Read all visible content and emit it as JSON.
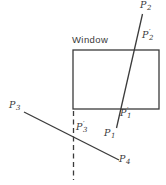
{
  "diagram": {
    "title": "Window",
    "background_color": "#ffffff",
    "stroke_color": "#3b3b3b",
    "text_color": "#3a3a3a",
    "window_rect": {
      "x": 73,
      "y": 50,
      "width": 86,
      "height": 59
    },
    "lines": [
      {
        "name": "line-p2-p1",
        "x1": 142.5,
        "y1": 14,
        "x2": 116.5,
        "y2": 128,
        "dashed": false
      },
      {
        "name": "line-p3-p4",
        "x1": 24,
        "y1": 112,
        "x2": 119,
        "y2": 160,
        "dashed": false
      },
      {
        "name": "window-left-edge-extension-dashed-line",
        "x1": 73.5,
        "y1": 111,
        "x2": 73.5,
        "y2": 180,
        "dashed": true
      }
    ],
    "labels": [
      {
        "name": "label-p2",
        "main": "P",
        "sub": "2",
        "prime": false,
        "x": 140,
        "y": 0
      },
      {
        "name": "label-p2-prime",
        "main": "P",
        "sub": "2",
        "prime": true,
        "x": 142,
        "y": 30
      },
      {
        "name": "label-p1-prime",
        "main": "P",
        "sub": "1",
        "prime": true,
        "x": 120,
        "y": 108
      },
      {
        "name": "label-p1",
        "main": "P",
        "sub": "1",
        "prime": false,
        "x": 104,
        "y": 128
      },
      {
        "name": "label-p3",
        "main": "P",
        "sub": "3",
        "prime": false,
        "x": 9,
        "y": 100
      },
      {
        "name": "label-p3-prime",
        "main": "P",
        "sub": "3",
        "prime": true,
        "x": 76,
        "y": 122
      },
      {
        "name": "label-p4",
        "main": "P",
        "sub": "4",
        "prime": false,
        "x": 119,
        "y": 154
      }
    ],
    "prime_glyph": "′"
  }
}
